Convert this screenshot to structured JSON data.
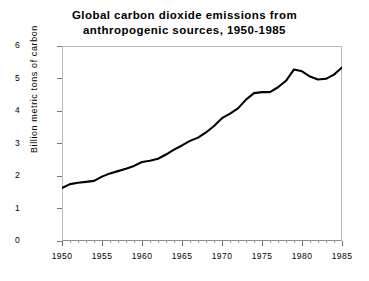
{
  "chart_data": {
    "type": "line",
    "title": "Global carbon dioxide emissions from anthropogenic sources, 1950-1985",
    "title_line1": "Global carbon dioxide emissions from",
    "title_line2": "anthropogenic sources, 1950-1985",
    "xlabel": "",
    "ylabel": "Billion metric tons of carbon",
    "xlim": [
      1950,
      1985
    ],
    "ylim": [
      0,
      6
    ],
    "grid": false,
    "legend": false,
    "line_color": "#000000",
    "x_major_ticks": [
      1950,
      1955,
      1960,
      1965,
      1970,
      1975,
      1980,
      1985
    ],
    "x_tick_labels": [
      "1950",
      "1955",
      "1960",
      "1965",
      "1970",
      "1975",
      "1980",
      "1985"
    ],
    "y_major_ticks": [
      0,
      1,
      2,
      3,
      4,
      5,
      6
    ],
    "y_tick_labels": [
      "0",
      "1",
      "2",
      "3",
      "4",
      "5",
      "6"
    ],
    "x": [
      1950,
      1951,
      1952,
      1953,
      1954,
      1955,
      1956,
      1957,
      1958,
      1959,
      1960,
      1961,
      1962,
      1963,
      1964,
      1965,
      1966,
      1967,
      1968,
      1969,
      1970,
      1971,
      1972,
      1973,
      1974,
      1975,
      1976,
      1977,
      1978,
      1979,
      1980,
      1981,
      1982,
      1983,
      1984,
      1985
    ],
    "values": [
      1.63,
      1.75,
      1.79,
      1.82,
      1.85,
      1.98,
      2.08,
      2.15,
      2.22,
      2.31,
      2.43,
      2.47,
      2.53,
      2.66,
      2.81,
      2.94,
      3.08,
      3.18,
      3.34,
      3.54,
      3.78,
      3.92,
      4.08,
      4.35,
      4.55,
      4.58,
      4.58,
      4.73,
      4.93,
      5.28,
      5.22,
      5.06,
      4.97,
      4.99,
      5.12,
      5.34
    ]
  }
}
